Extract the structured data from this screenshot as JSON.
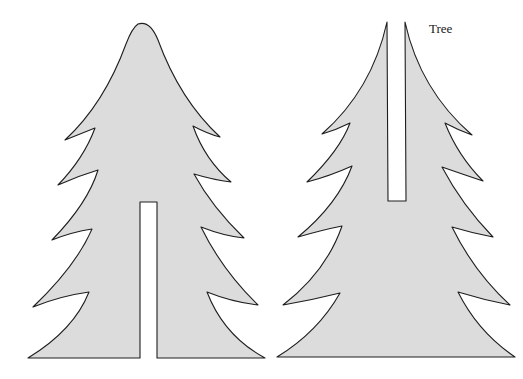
{
  "figure": {
    "label": "Tree",
    "colors": {
      "fill": "#dcdcdc",
      "stroke": "#1e1e1e",
      "background": "#ffffff"
    },
    "pieces": [
      {
        "name": "tree-piece-slot-from-bottom",
        "description": "Tree cutout with vertical slot from base upward"
      },
      {
        "name": "tree-piece-slot-from-top",
        "description": "Tree cutout split by vertical slot from tip downward"
      }
    ]
  }
}
